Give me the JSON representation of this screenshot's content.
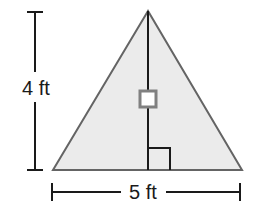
{
  "figure": {
    "kind": "geometry-diagram",
    "shape_name": "triangle",
    "description_title": "Triangle with base 5 ft and height 4 ft",
    "background_color": "#ffffff"
  },
  "triangle": {
    "fill_color": "#ebebeb",
    "stroke_color": "#646464",
    "stroke_width": 2,
    "apex": {
      "x": 148,
      "y": 11
    },
    "base_left": {
      "x": 53,
      "y": 170
    },
    "base_right": {
      "x": 242,
      "y": 170
    }
  },
  "height_segment": {
    "name": "height-line",
    "stroke_color": "#1a1a1a",
    "stroke_width": 2,
    "from": {
      "x": 148,
      "y": 11
    },
    "to": {
      "x": 148,
      "y": 170
    }
  },
  "tick_marker": {
    "name": "height-tick-square",
    "center": {
      "x": 148,
      "y": 99
    },
    "size": 19,
    "fill_color": "#ffffff",
    "stroke_color": "#808080",
    "stroke_width": 3
  },
  "right_angle_marker": {
    "name": "right-angle-square",
    "stroke_color": "#1a1a1a",
    "stroke_width": 2,
    "corner": {
      "x": 148,
      "y": 170
    },
    "arm_length": 22,
    "direction": "right"
  },
  "dimensions": {
    "height": {
      "label": "4 ft",
      "value": 4,
      "unit": "ft",
      "orientation": "vertical",
      "label_x": 36,
      "label_baseline_y": 95,
      "line_x": 35,
      "cap_half_width": 8,
      "top_y": 12,
      "bottom_y": 170,
      "gap_top_y": 72,
      "gap_bottom_y": 102,
      "stroke_color": "#1a1a1a",
      "stroke_width": 2
    },
    "base": {
      "label": "5 ft",
      "value": 5,
      "unit": "ft",
      "orientation": "horizontal",
      "label_x": 143,
      "label_baseline_y": 199,
      "line_y": 192,
      "cap_half_height": 9,
      "left_x": 52,
      "right_x": 240,
      "gap_left_x": 121,
      "gap_right_x": 166,
      "stroke_color": "#1a1a1a",
      "stroke_width": 2
    }
  }
}
